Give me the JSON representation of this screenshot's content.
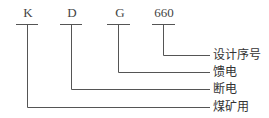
{
  "diagram": {
    "type": "model-code-breakdown",
    "codes": [
      {
        "symbol": "K",
        "meaning": "煤矿用"
      },
      {
        "symbol": "D",
        "meaning": "断电"
      },
      {
        "symbol": "G",
        "meaning": "馈电"
      },
      {
        "symbol": "660",
        "meaning": "设计序号"
      }
    ],
    "labels": [
      "设计序号",
      "馈电",
      "断电",
      "煤矿用"
    ],
    "line_color": "#555555"
  }
}
